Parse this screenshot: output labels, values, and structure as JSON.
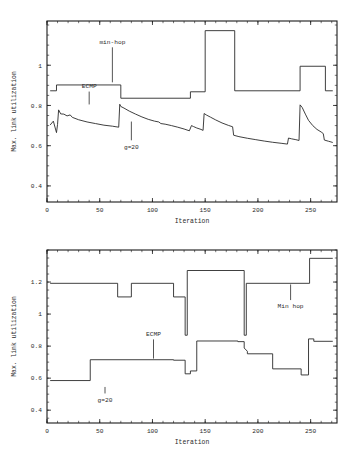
{
  "page": {
    "background": "#ffffff",
    "line_color": "#2a2a2a"
  },
  "chart_data": [
    {
      "id": "top",
      "type": "line",
      "title": "",
      "xlabel": "Iteration",
      "ylabel": "Max. link utilization",
      "xlim": [
        0,
        275
      ],
      "ylim": [
        0.32,
        1.22
      ],
      "xticks": [
        0,
        50,
        100,
        150,
        200,
        250
      ],
      "xticklabels": [
        "0",
        "50",
        "100",
        "150",
        "200",
        "250"
      ],
      "yticks": [
        0.4,
        0.6,
        0.8,
        1.0
      ],
      "yticklabels": [
        "0.4",
        "0.6",
        "0.8",
        "1"
      ],
      "grid": false,
      "legend": "annotations",
      "annotations": [
        {
          "label": "min-hop",
          "text_x": 62,
          "text_y": 1.105,
          "point_x": 62,
          "point_y": 0.915
        },
        {
          "label": "ECMP",
          "text_x": 40,
          "text_y": 0.885,
          "point_x": 40,
          "point_y": 0.805
        },
        {
          "label": "g=20",
          "text_x": 80,
          "text_y": 0.585,
          "point_x": 80,
          "point_y": 0.72
        }
      ],
      "series": [
        {
          "name": "min-hop",
          "step": true,
          "points": [
            [
              3,
              0.873
            ],
            [
              9,
              0.873
            ],
            [
              9,
              0.902
            ],
            [
              70,
              0.902
            ],
            [
              70,
              0.836
            ],
            [
              136,
              0.836
            ],
            [
              136,
              0.868
            ],
            [
              150,
              0.868
            ],
            [
              150,
              1.172
            ],
            [
              178,
              1.172
            ],
            [
              178,
              0.873
            ],
            [
              240,
              0.873
            ],
            [
              240,
              0.995
            ],
            [
              264,
              0.995
            ],
            [
              264,
              0.873
            ],
            [
              271,
              0.873
            ]
          ]
        },
        {
          "name": "g=20",
          "step": false,
          "points": [
            [
              3,
              0.703
            ],
            [
              6,
              0.722
            ],
            [
              9,
              0.665
            ],
            [
              10,
              0.706
            ],
            [
              11,
              0.778
            ],
            [
              13,
              0.758
            ],
            [
              16,
              0.757
            ],
            [
              19,
              0.748
            ],
            [
              22,
              0.753
            ],
            [
              24,
              0.741
            ],
            [
              30,
              0.729
            ],
            [
              38,
              0.718
            ],
            [
              46,
              0.71
            ],
            [
              54,
              0.702
            ],
            [
              62,
              0.697
            ],
            [
              68,
              0.692
            ],
            [
              69,
              0.806
            ],
            [
              70,
              0.795
            ],
            [
              73,
              0.787
            ],
            [
              78,
              0.772
            ],
            [
              84,
              0.757
            ],
            [
              90,
              0.743
            ],
            [
              96,
              0.731
            ],
            [
              102,
              0.722
            ],
            [
              106,
              0.718
            ],
            [
              108,
              0.71
            ],
            [
              112,
              0.707
            ],
            [
              118,
              0.7
            ],
            [
              124,
              0.692
            ],
            [
              130,
              0.683
            ],
            [
              135,
              0.674
            ],
            [
              137,
              0.7
            ],
            [
              139,
              0.695
            ],
            [
              142,
              0.688
            ],
            [
              146,
              0.681
            ],
            [
              148,
              0.676
            ],
            [
              149,
              0.76
            ],
            [
              151,
              0.753
            ],
            [
              155,
              0.742
            ],
            [
              160,
              0.728
            ],
            [
              166,
              0.713
            ],
            [
              172,
              0.701
            ],
            [
              176,
              0.694
            ],
            [
              177,
              0.652
            ],
            [
              182,
              0.645
            ],
            [
              190,
              0.637
            ],
            [
              198,
              0.63
            ],
            [
              206,
              0.623
            ],
            [
              214,
              0.617
            ],
            [
              222,
              0.612
            ],
            [
              228,
              0.608
            ],
            [
              229,
              0.638
            ],
            [
              232,
              0.634
            ],
            [
              236,
              0.63
            ],
            [
              239,
              0.626
            ],
            [
              240,
              0.803
            ],
            [
              242,
              0.79
            ],
            [
              245,
              0.757
            ],
            [
              248,
              0.726
            ],
            [
              252,
              0.7
            ],
            [
              256,
              0.681
            ],
            [
              260,
              0.668
            ],
            [
              262,
              0.66
            ],
            [
              263,
              0.628
            ],
            [
              267,
              0.622
            ],
            [
              271,
              0.616
            ]
          ]
        }
      ]
    },
    {
      "id": "bottom",
      "type": "line",
      "title": "",
      "xlabel": "Iteration",
      "ylabel": "Max. link utilization",
      "xlim": [
        0,
        275
      ],
      "ylim": [
        0.32,
        1.4
      ],
      "xticks": [
        0,
        50,
        100,
        150,
        200,
        250
      ],
      "xticklabels": [
        "0",
        "50",
        "100",
        "150",
        "200",
        "250"
      ],
      "yticks": [
        0.4,
        0.6,
        0.8,
        1.0,
        1.2
      ],
      "yticklabels": [
        "0.4",
        "0.6",
        "0.8",
        "1",
        "1.2"
      ],
      "grid": false,
      "legend": "annotations",
      "annotations": [
        {
          "label": "Min hop",
          "text_x": 231,
          "text_y": 1.035,
          "point_x": 231,
          "point_y": 1.185
        },
        {
          "label": "ECMP",
          "text_x": 101,
          "text_y": 0.862,
          "point_x": 101,
          "point_y": 0.722
        },
        {
          "label": "g=20",
          "text_x": 55,
          "text_y": 0.452,
          "point_x": 55,
          "point_y": 0.545
        }
      ],
      "series": [
        {
          "name": "Min hop",
          "step": true,
          "points": [
            [
              3,
              1.192
            ],
            [
              67,
              1.192
            ],
            [
              67,
              1.107
            ],
            [
              80,
              1.107
            ],
            [
              80,
              1.192
            ],
            [
              120,
              1.192
            ],
            [
              120,
              1.107
            ],
            [
              131,
              1.107
            ],
            [
              131,
              0.868
            ],
            [
              133,
              0.868
            ],
            [
              133,
              1.272
            ],
            [
              187,
              1.272
            ],
            [
              187,
              0.868
            ],
            [
              189,
              0.868
            ],
            [
              189,
              1.192
            ],
            [
              249,
              1.192
            ],
            [
              249,
              1.348
            ],
            [
              271,
              1.348
            ]
          ]
        },
        {
          "name": "g=20",
          "step": true,
          "points": [
            [
              3,
              0.585
            ],
            [
              41,
              0.585
            ],
            [
              41,
              0.715
            ],
            [
              120,
              0.715
            ],
            [
              120,
              0.712
            ],
            [
              131,
              0.712
            ],
            [
              131,
              0.627
            ],
            [
              136,
              0.627
            ],
            [
              136,
              0.645
            ],
            [
              142,
              0.645
            ],
            [
              142,
              0.832
            ],
            [
              181,
              0.832
            ],
            [
              181,
              0.828
            ],
            [
              187,
              0.828
            ],
            [
              187,
              0.788
            ],
            [
              190,
              0.768
            ],
            [
              190,
              0.752
            ],
            [
              214,
              0.752
            ],
            [
              214,
              0.658
            ],
            [
              241,
              0.658
            ],
            [
              241,
              0.62
            ],
            [
              248,
              0.62
            ],
            [
              248,
              0.845
            ],
            [
              253,
              0.845
            ],
            [
              253,
              0.83
            ],
            [
              271,
              0.83
            ]
          ]
        }
      ]
    }
  ]
}
